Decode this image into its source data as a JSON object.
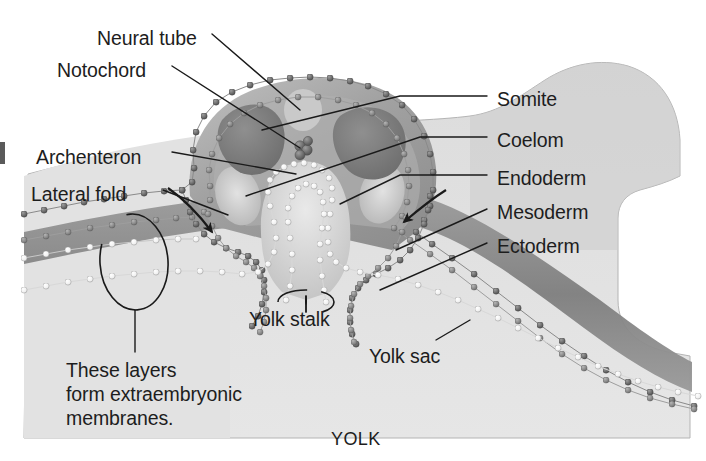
{
  "figure": {
    "kind": "biological-diagram",
    "background_color": "#ffffff",
    "body_fill_light": "#d9d9d9",
    "body_fill_mid": "#b9b9b9",
    "body_fill_dark": "#8d8d8d",
    "ink_color": "#1d1d1d"
  },
  "labels": [
    {
      "id": "neural-tube",
      "text": "Neural tube",
      "x": 97,
      "y": 27,
      "align": "left"
    },
    {
      "id": "notochord",
      "text": "Notochord",
      "x": 57,
      "y": 59,
      "align": "left"
    },
    {
      "id": "archenteron",
      "text": "Archenteron",
      "x": 36,
      "y": 146,
      "align": "left"
    },
    {
      "id": "lateral-fold",
      "text": "Lateral fold",
      "x": 31,
      "y": 183,
      "align": "left"
    },
    {
      "id": "somite",
      "text": "Somite",
      "x": 497,
      "y": 88,
      "align": "left"
    },
    {
      "id": "coelom",
      "text": "Coelom",
      "x": 497,
      "y": 129,
      "align": "left"
    },
    {
      "id": "endoderm",
      "text": "Endoderm",
      "x": 497,
      "y": 167,
      "align": "left"
    },
    {
      "id": "mesoderm",
      "text": "Mesoderm",
      "x": 497,
      "y": 201,
      "align": "left"
    },
    {
      "id": "ectoderm",
      "text": "Ectoderm",
      "x": 497,
      "y": 235,
      "align": "left"
    },
    {
      "id": "yolk-stalk",
      "text": "Yolk stalk",
      "x": 249,
      "y": 308,
      "align": "left"
    },
    {
      "id": "yolk-sac",
      "text": "Yolk sac",
      "x": 369,
      "y": 345,
      "align": "left"
    },
    {
      "id": "yolk",
      "text": "YOLK",
      "x": 331,
      "y": 428,
      "align": "left",
      "style": "small-caps"
    }
  ],
  "callout_note": {
    "id": "extraembryonic-note",
    "text": "These layers\nform extraembryonic\nmembranes.",
    "lines": [
      "These layers",
      "form extraembryonic",
      "membranes."
    ],
    "x": 66,
    "y": 358
  },
  "germ_layers": [
    {
      "name": "Ectoderm",
      "bead_color": "#6f6f6f",
      "description": "outermost dark bead layer"
    },
    {
      "name": "Mesoderm",
      "bead_color": "#8a8a8a",
      "description": "middle bead layer"
    },
    {
      "name": "Endoderm",
      "bead_color": "#f2f2f2",
      "description": "innermost white bead layer lining archenteron and yolk sac"
    }
  ],
  "structures": [
    {
      "name": "Neural tube",
      "type": "cavity-ring"
    },
    {
      "name": "Notochord",
      "type": "small-cell-cluster"
    },
    {
      "name": "Somite",
      "type": "cell-block",
      "count": 2
    },
    {
      "name": "Coelom",
      "type": "cavity",
      "count": 2
    },
    {
      "name": "Archenteron",
      "type": "cavity"
    },
    {
      "name": "Lateral fold",
      "type": "fold",
      "count": 2
    },
    {
      "name": "Yolk stalk",
      "type": "constriction"
    },
    {
      "name": "Yolk sac",
      "type": "membrane"
    }
  ],
  "arrows": [
    {
      "id": "lateral-fold-arrow-left",
      "direction": "down-right",
      "meaning": "direction of left lateral fold movement"
    },
    {
      "id": "lateral-fold-arrow-right",
      "direction": "down-left",
      "meaning": "direction of right lateral fold movement"
    }
  ],
  "annotations": {
    "brace_circle_left": "ellipse outlining the four stacked layers on the left band",
    "stalk_ellipse": "small ellipse marking the yolk stalk constriction"
  }
}
